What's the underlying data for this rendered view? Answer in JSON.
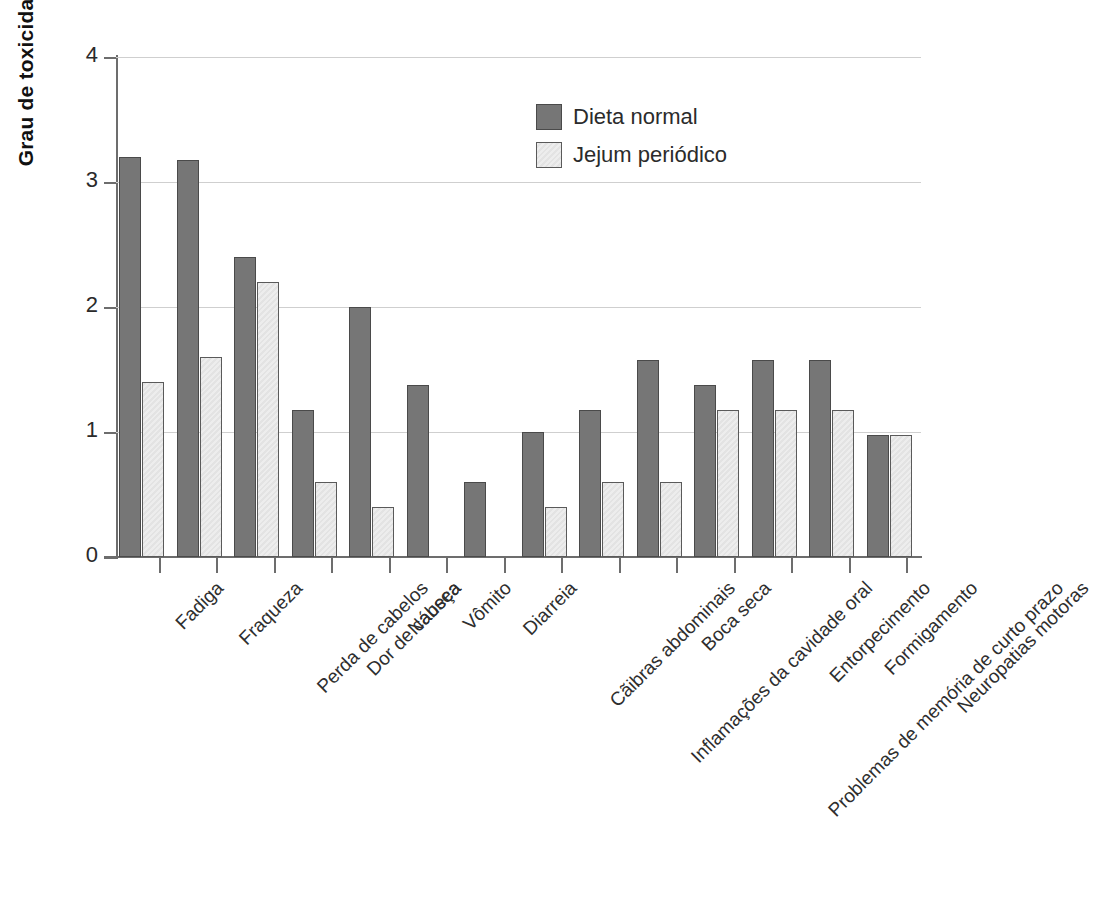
{
  "chart_data": {
    "type": "bar",
    "title": "",
    "xlabel": "",
    "ylabel": "Grau de toxicidade",
    "ylim": [
      0,
      4
    ],
    "yticks": [
      "0",
      "1",
      "2",
      "3",
      "4"
    ],
    "grid": true,
    "legend_position": "top-center",
    "categories": [
      "Fadiga",
      "Fraqueza",
      "Perda de cabelos",
      "Dor de cabeça",
      "Náusea",
      "Vômito",
      "Diarreia",
      "Cãibras abdominais",
      "Inflamações da cavidade oral",
      "Boca seca",
      "Problemas de memória de curto prazo",
      "Entorpecimento",
      "Formigamento",
      "Neuropatias motoras"
    ],
    "series": [
      {
        "name": "Dieta normal",
        "color": "#767676",
        "values": [
          3.2,
          3.18,
          2.4,
          1.18,
          2.0,
          1.38,
          0.6,
          1.0,
          1.18,
          1.58,
          1.38,
          1.58,
          1.58,
          0.98
        ]
      },
      {
        "name": "Jejum periódico",
        "color": "#ededed",
        "values": [
          1.4,
          1.6,
          2.2,
          0.6,
          0.4,
          0,
          0,
          0.4,
          0.6,
          0.6,
          1.18,
          1.18,
          1.18,
          0.98
        ]
      }
    ]
  },
  "legend": {
    "items": [
      {
        "label": "Dieta normal",
        "swatch": "dark"
      },
      {
        "label": "Jejum periódico",
        "swatch": "light"
      }
    ]
  }
}
